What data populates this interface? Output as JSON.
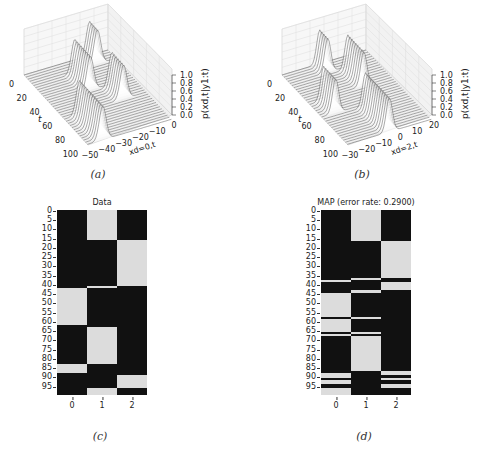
{
  "figure": {
    "panels": [
      {
        "id": "a",
        "caption": "(a)"
      },
      {
        "id": "b",
        "caption": "(b)"
      },
      {
        "id": "c",
        "caption": "(c)"
      },
      {
        "id": "d",
        "caption": "(d)"
      }
    ]
  },
  "chart_data": [
    {
      "type": "area",
      "panel": "a",
      "title": "",
      "xlabel": "x_{d=0,t}",
      "ylabel": "t",
      "zlabel": "p(x_{d,t}|y_{1:t})",
      "x_ticks": [
        "-50",
        "-40",
        "-30",
        "-20",
        "-10",
        "0"
      ],
      "y_ticks": [
        "0",
        "20",
        "40",
        "60",
        "80",
        "100"
      ],
      "z_ticks": [
        "0.0",
        "0.2",
        "0.4",
        "0.6",
        "0.8",
        "1.0"
      ],
      "xlim": [
        -55,
        0
      ],
      "ylim": [
        0,
        100
      ],
      "zlim": [
        0,
        1.0
      ],
      "description": "Waterfall of filtering densities over time; peaks near x≈-10 for t 0-15, drifting to x≈-30 around t 20-40, returning near x≈-15 around t 45-60, then shifting to x≈-45 for t 60-100"
    },
    {
      "type": "area",
      "panel": "b",
      "title": "",
      "xlabel": "x_{d=2,t}",
      "ylabel": "t",
      "zlabel": "p(x_{d,t}|y_{1:t})",
      "x_ticks": [
        "-30",
        "-20",
        "-10",
        "0",
        "10",
        "20"
      ],
      "y_ticks": [
        "0",
        "20",
        "40",
        "60",
        "80",
        "100"
      ],
      "z_ticks": [
        "0.0",
        "0.2",
        "0.4",
        "0.6",
        "0.8",
        "1.0"
      ],
      "xlim": [
        -35,
        25
      ],
      "ylim": [
        0,
        100
      ],
      "zlim": [
        0,
        1.0
      ],
      "description": "Waterfall of filtering densities; peaks near x≈-10 for t 0-15, moving to x≈5 for t 20-40, then to x≈-25 for t 45-60, returning near x≈-5 toward t 60-100"
    },
    {
      "type": "heatmap",
      "panel": "c",
      "title": "Data",
      "xlabel": "",
      "ylabel": "",
      "x_ticks": [
        "0",
        "1",
        "2"
      ],
      "y_ticks": [
        "0",
        "5",
        "10",
        "15",
        "20",
        "25",
        "30",
        "35",
        "40",
        "45",
        "50",
        "55",
        "60",
        "65",
        "70",
        "75",
        "80",
        "85",
        "90",
        "95"
      ],
      "n_rows": 100,
      "colors": {
        "on": "#dcdcdc",
        "off": "#111111"
      },
      "on_segments": [
        {
          "col": 0,
          "start": 42,
          "end": 62
        },
        {
          "col": 0,
          "start": 83,
          "end": 88
        },
        {
          "col": 1,
          "start": 0,
          "end": 16
        },
        {
          "col": 1,
          "start": 41,
          "end": 42
        },
        {
          "col": 1,
          "start": 63,
          "end": 83
        },
        {
          "col": 1,
          "start": 96,
          "end": 100
        },
        {
          "col": 2,
          "start": 16,
          "end": 41
        },
        {
          "col": 2,
          "start": 89,
          "end": 96
        }
      ]
    },
    {
      "type": "heatmap",
      "panel": "d",
      "title": "MAP (error rate: 0.2900)",
      "xlabel": "",
      "ylabel": "",
      "x_ticks": [
        "0",
        "1",
        "2"
      ],
      "y_ticks": [
        "0",
        "5",
        "10",
        "15",
        "20",
        "25",
        "30",
        "35",
        "40",
        "45",
        "50",
        "55",
        "60",
        "65",
        "70",
        "75",
        "80",
        "85",
        "90",
        "95"
      ],
      "n_rows": 100,
      "error_rate": 0.29,
      "colors": {
        "on": "#dcdcdc",
        "off": "#111111"
      },
      "on_segments": [
        {
          "col": 0,
          "start": 38,
          "end": 39
        },
        {
          "col": 0,
          "start": 45,
          "end": 58
        },
        {
          "col": 0,
          "start": 59,
          "end": 66
        },
        {
          "col": 0,
          "start": 67,
          "end": 68
        },
        {
          "col": 0,
          "start": 88,
          "end": 91
        },
        {
          "col": 0,
          "start": 92,
          "end": 94
        },
        {
          "col": 0,
          "start": 96,
          "end": 100
        },
        {
          "col": 1,
          "start": 0,
          "end": 17
        },
        {
          "col": 1,
          "start": 37,
          "end": 38
        },
        {
          "col": 1,
          "start": 43,
          "end": 45
        },
        {
          "col": 1,
          "start": 58,
          "end": 59
        },
        {
          "col": 1,
          "start": 66,
          "end": 67
        },
        {
          "col": 1,
          "start": 68,
          "end": 87
        },
        {
          "col": 2,
          "start": 17,
          "end": 37
        },
        {
          "col": 2,
          "start": 39,
          "end": 43
        },
        {
          "col": 2,
          "start": 87,
          "end": 89
        },
        {
          "col": 2,
          "start": 91,
          "end": 92
        },
        {
          "col": 2,
          "start": 94,
          "end": 96
        }
      ]
    }
  ]
}
